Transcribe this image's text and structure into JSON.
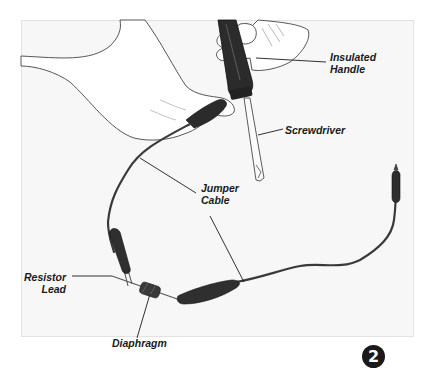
{
  "figure": {
    "step_number": "2",
    "labels": {
      "insulated_handle": "Insulated\nHandle",
      "screwdriver": "Screwdriver",
      "jumper_cable": "Jumper\nCable",
      "resistor_lead": "Resistor\nLead",
      "diaphragm": "Diaphragm"
    },
    "colors": {
      "panel_bg": "#f7f7f7",
      "ink": "#1a1a1a",
      "cable": "#3a3a3a",
      "handle": "#2b2b2b",
      "badge_bg": "#1a1a1a",
      "badge_text": "#ffffff"
    }
  }
}
